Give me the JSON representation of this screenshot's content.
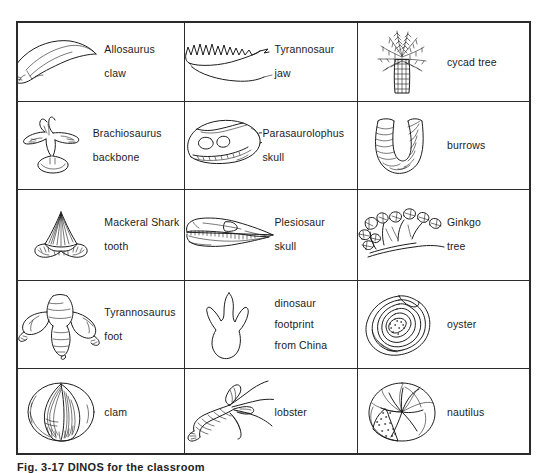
{
  "figure": {
    "caption": "Fig. 3-17  DINOS for the classroom",
    "columns": 3,
    "rows": 5,
    "border_color": "#2b2b2b",
    "ink_color": "#1d1d1d",
    "background": "#ffffff"
  },
  "cells": [
    {
      "id": "allosaurus-claw",
      "icon": "allosaurus-claw-icon",
      "lines": [
        "Allosaurus",
        "claw"
      ]
    },
    {
      "id": "tyrannosaur-jaw",
      "icon": "tyrannosaur-jaw-icon",
      "lines": [
        "Tyrannosaur",
        "jaw"
      ]
    },
    {
      "id": "cycad-tree",
      "icon": "cycad-tree-icon",
      "lines": [
        "cycad  tree"
      ]
    },
    {
      "id": "brachiosaurus-backbone",
      "icon": "brachiosaurus-backbone-icon",
      "lines": [
        "Brachiosaurus",
        "backbone"
      ]
    },
    {
      "id": "parasaurolophus-skull",
      "icon": "parasaurolophus-skull-icon",
      "lines": [
        "Parasaurolophus",
        "skull"
      ]
    },
    {
      "id": "burrows",
      "icon": "burrows-icon",
      "lines": [
        "burrows"
      ]
    },
    {
      "id": "mackeral-shark-tooth",
      "icon": "shark-tooth-icon",
      "lines": [
        "Mackeral Shark",
        "tooth"
      ]
    },
    {
      "id": "plesiosaur-skull",
      "icon": "plesiosaur-skull-icon",
      "lines": [
        "Plesiosaur",
        "skull"
      ]
    },
    {
      "id": "ginkgo-tree",
      "icon": "ginkgo-tree-icon",
      "lines": [
        "Ginkgo",
        "tree"
      ]
    },
    {
      "id": "tyrannosaurus-foot",
      "icon": "tyrannosaurus-foot-icon",
      "lines": [
        "Tyrannosaurus",
        "foot"
      ]
    },
    {
      "id": "dinosaur-footprint",
      "icon": "dinosaur-footprint-icon",
      "lines": [
        "dinosaur",
        "footprint",
        "from  China"
      ]
    },
    {
      "id": "oyster",
      "icon": "oyster-icon",
      "lines": [
        "oyster"
      ]
    },
    {
      "id": "clam",
      "icon": "clam-icon",
      "lines": [
        "clam"
      ]
    },
    {
      "id": "lobster",
      "icon": "lobster-icon",
      "lines": [
        "lobster"
      ]
    },
    {
      "id": "nautilus",
      "icon": "nautilus-icon",
      "lines": [
        "nautilus"
      ]
    }
  ]
}
